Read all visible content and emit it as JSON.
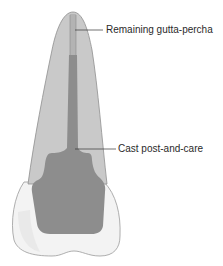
{
  "figure": {
    "labels": {
      "gutta_percha": "Remaining gutta-percha",
      "cast_post": "Cast post-and-care"
    },
    "colors": {
      "root": "#c9c9c9",
      "root_outline": "#8f8f8f",
      "gutta_percha": "#a9a9a9",
      "post": "#8d8d8d",
      "crown": "#f3f3f3",
      "crown_outline": "#9a9a9a",
      "leader_line": "#333333"
    }
  }
}
